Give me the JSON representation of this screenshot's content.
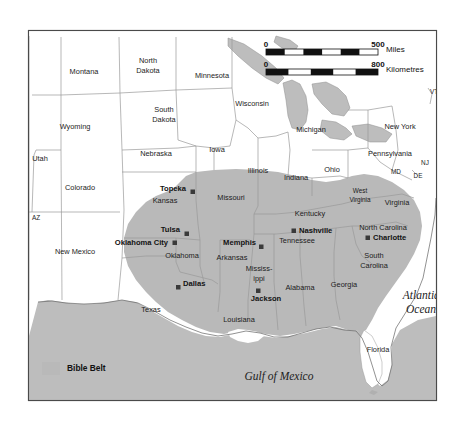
{
  "figure": {
    "border_color": "#4a4a4a",
    "background_color": "#ffffff"
  },
  "colors": {
    "bible_belt_fill": "#b9b9b9",
    "land_fill": "#ffffff",
    "water_fill": "#bdbdbd",
    "state_border": "#9a9a9a",
    "outline": "#555555",
    "text": "#1c1c1c"
  },
  "legend": {
    "swatch_color": "#b9b9b9",
    "label": "Bible Belt"
  },
  "scale_bar": {
    "miles": {
      "start": "0",
      "end": "500",
      "unit": "Miles"
    },
    "kilometres": {
      "start": "0",
      "end": "800",
      "unit": "Kilometres"
    }
  },
  "water_labels": [
    {
      "name": "Gulf of Mexico",
      "x": 279,
      "y": 377
    },
    {
      "name": "Atlantic Ocean",
      "x": 421,
      "y": 302,
      "lines": [
        "Atlantic",
        "Ocean"
      ]
    }
  ],
  "states": [
    {
      "name": "Montana",
      "x": 84,
      "y": 72,
      "in_belt": false
    },
    {
      "name": "North Dakota",
      "x": 148,
      "y": 66,
      "in_belt": false,
      "lines": [
        "North",
        "Dakota"
      ]
    },
    {
      "name": "Minnesota",
      "x": 212,
      "y": 76,
      "in_belt": false
    },
    {
      "name": "Wisconsin",
      "x": 252,
      "y": 104,
      "in_belt": false
    },
    {
      "name": "Michigan",
      "x": 311,
      "y": 130,
      "in_belt": false
    },
    {
      "name": "New York",
      "x": 400,
      "y": 127,
      "in_belt": false
    },
    {
      "name": "VT",
      "x": 434,
      "y": 92,
      "in_belt": false,
      "small": true
    },
    {
      "name": "South Dakota",
      "x": 164,
      "y": 115,
      "in_belt": false,
      "lines": [
        "South",
        "Dakota"
      ]
    },
    {
      "name": "Wyoming",
      "x": 75,
      "y": 127,
      "in_belt": false
    },
    {
      "name": "Nebraska",
      "x": 156,
      "y": 154,
      "in_belt": false
    },
    {
      "name": "Iowa",
      "x": 217,
      "y": 150,
      "in_belt": false
    },
    {
      "name": "Illinois",
      "x": 258,
      "y": 171,
      "in_belt": false
    },
    {
      "name": "Indiana",
      "x": 296,
      "y": 178,
      "in_belt": false
    },
    {
      "name": "Ohio",
      "x": 332,
      "y": 170,
      "in_belt": false
    },
    {
      "name": "Pennsylvania",
      "x": 390,
      "y": 154,
      "in_belt": false
    },
    {
      "name": "NJ",
      "x": 425,
      "y": 163,
      "in_belt": false,
      "small": true
    },
    {
      "name": "MD",
      "x": 396,
      "y": 172,
      "in_belt": false,
      "small": true
    },
    {
      "name": "DE",
      "x": 418,
      "y": 176,
      "in_belt": false,
      "small": true
    },
    {
      "name": "Utah",
      "x": 40,
      "y": 159,
      "in_belt": false
    },
    {
      "name": "Colorado",
      "x": 80,
      "y": 188,
      "in_belt": false
    },
    {
      "name": "Kansas",
      "x": 165,
      "y": 201,
      "in_belt": true
    },
    {
      "name": "Missouri",
      "x": 231,
      "y": 198,
      "in_belt": true
    },
    {
      "name": "Kentucky",
      "x": 310,
      "y": 214,
      "in_belt": true
    },
    {
      "name": "West Virginia",
      "x": 360,
      "y": 196,
      "in_belt": true,
      "lines": [
        "West",
        "Virginia"
      ],
      "small": true
    },
    {
      "name": "Virginia",
      "x": 397,
      "y": 203,
      "in_belt": true
    },
    {
      "name": "AZ",
      "x": 36,
      "y": 218,
      "in_belt": false,
      "small": true
    },
    {
      "name": "New Mexico",
      "x": 75,
      "y": 252,
      "in_belt": false
    },
    {
      "name": "Oklahoma",
      "x": 182,
      "y": 256,
      "in_belt": true
    },
    {
      "name": "Arkansas",
      "x": 232,
      "y": 258,
      "in_belt": true
    },
    {
      "name": "Tennessee",
      "x": 297,
      "y": 241,
      "in_belt": true
    },
    {
      "name": "North Carolina",
      "x": 383,
      "y": 228,
      "in_belt": true
    },
    {
      "name": "South Carolina",
      "x": 374,
      "y": 261,
      "in_belt": true,
      "lines": [
        "South",
        "Carolina"
      ]
    },
    {
      "name": "Texas",
      "x": 151,
      "y": 310,
      "in_belt": true
    },
    {
      "name": "Mississippi",
      "x": 259,
      "y": 274,
      "in_belt": true,
      "lines": [
        "Mississ-",
        "ippi"
      ]
    },
    {
      "name": "Alabama",
      "x": 300,
      "y": 288,
      "in_belt": true
    },
    {
      "name": "Georgia",
      "x": 344,
      "y": 285,
      "in_belt": true
    },
    {
      "name": "Louisiana",
      "x": 239,
      "y": 320,
      "in_belt": true
    },
    {
      "name": "Florida",
      "x": 378,
      "y": 350,
      "in_belt": false
    }
  ],
  "cities": [
    {
      "name": "Topeka",
      "label_x": 186,
      "label_y": 189,
      "marker_x": 193,
      "marker_y": 192,
      "anchor": "end"
    },
    {
      "name": "Tulsa",
      "label_x": 180,
      "label_y": 230,
      "marker_x": 187,
      "marker_y": 234,
      "anchor": "end"
    },
    {
      "name": "Oklahoma City",
      "label_x": 168,
      "label_y": 243,
      "marker_x": 175,
      "marker_y": 243,
      "anchor": "end"
    },
    {
      "name": "Dallas",
      "label_x": 182,
      "label_y": 284,
      "marker_x": 178,
      "marker_y": 287,
      "anchor": "start"
    },
    {
      "name": "Memphis",
      "label_x": 256,
      "label_y": 243,
      "marker_x": 261,
      "marker_y": 247,
      "anchor": "end"
    },
    {
      "name": "Jackson",
      "label_x": 266,
      "label_y": 299,
      "marker_x": 258,
      "marker_y": 291,
      "anchor": "middle"
    },
    {
      "name": "Nashville",
      "label_x": 301,
      "label_y": 231,
      "marker_x": 294,
      "marker_y": 231,
      "anchor": "start"
    },
    {
      "name": "Charlotte",
      "label_x": 374,
      "label_y": 238,
      "marker_x": 368,
      "marker_y": 238,
      "anchor": "start"
    }
  ]
}
